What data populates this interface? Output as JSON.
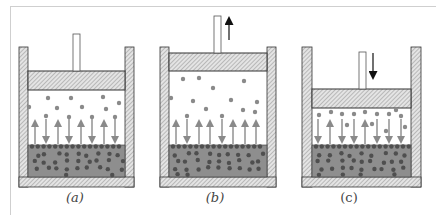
{
  "figure": {
    "panels": [
      {
        "id": "a",
        "label": "(a)",
        "label_x": 60,
        "wall_left_x": 19,
        "wall_right_x": 125,
        "wall_width": 9,
        "wall_top_y": 47,
        "floor_bottom_y": 187,
        "piston_top_y": 71,
        "piston_bottom_y": 90,
        "rod_x": 73,
        "rod_width": 7,
        "rod_top_y": 34,
        "motion_arrow": null,
        "liquid_top_y": 145,
        "liquid_bottom_y": 177,
        "arrows": [
          {
            "x": 35,
            "dir": "up"
          },
          {
            "x": 46,
            "dir": "down"
          },
          {
            "x": 58,
            "dir": "up"
          },
          {
            "x": 69,
            "dir": "down"
          },
          {
            "x": 81,
            "dir": "up"
          },
          {
            "x": 92,
            "dir": "down"
          },
          {
            "x": 104,
            "dir": "up"
          },
          {
            "x": 115,
            "dir": "down"
          }
        ],
        "gas_particles": [
          [
            48,
            98
          ],
          [
            71,
            98
          ],
          [
            103,
            97
          ],
          [
            29,
            107
          ],
          [
            57,
            108
          ],
          [
            82,
            107
          ],
          [
            106,
            109
          ],
          [
            119,
            103
          ],
          [
            46,
            116
          ],
          [
            69,
            117
          ],
          [
            92,
            117
          ],
          [
            115,
            117
          ]
        ]
      },
      {
        "id": "b",
        "label": "(b)",
        "label_x": 200,
        "wall_left_x": 160,
        "wall_right_x": 267,
        "wall_width": 9,
        "wall_top_y": 47,
        "floor_bottom_y": 187,
        "piston_top_y": 53,
        "piston_bottom_y": 71,
        "rod_x": 214,
        "rod_width": 7,
        "rod_top_y": 16,
        "motion_arrow": {
          "x": 229,
          "dir": "up",
          "y1": 17,
          "y2": 40
        },
        "liquid_top_y": 145,
        "liquid_bottom_y": 177,
        "arrows": [
          {
            "x": 176,
            "dir": "up"
          },
          {
            "x": 187,
            "dir": "down"
          },
          {
            "x": 199,
            "dir": "up"
          },
          {
            "x": 210,
            "dir": "up"
          },
          {
            "x": 222,
            "dir": "down"
          },
          {
            "x": 233,
            "dir": "up"
          },
          {
            "x": 245,
            "dir": "up"
          },
          {
            "x": 256,
            "dir": "up"
          }
        ],
        "gas_particles": [
          [
            183,
            79
          ],
          [
            199,
            78
          ],
          [
            213,
            88
          ],
          [
            244,
            81
          ],
          [
            171,
            98
          ],
          [
            193,
            101
          ],
          [
            231,
            100
          ],
          [
            257,
            102
          ],
          [
            206,
            109
          ],
          [
            243,
            110
          ],
          [
            187,
            116
          ],
          [
            222,
            116
          ],
          [
            255,
            112
          ]
        ]
      },
      {
        "id": "c",
        "label": "(c)",
        "label_x": 347,
        "wall_left_x": 302,
        "wall_right_x": 411,
        "wall_width": 10,
        "wall_top_y": 47,
        "floor_bottom_y": 187,
        "piston_top_y": 89,
        "piston_bottom_y": 108,
        "rod_x": 359,
        "rod_width": 7,
        "rod_top_y": 52,
        "motion_arrow": {
          "x": 373,
          "dir": "down",
          "y1": 53,
          "y2": 79
        },
        "liquid_top_y": 145,
        "liquid_bottom_y": 177,
        "arrows": [
          {
            "x": 318,
            "dir": "down"
          },
          {
            "x": 330,
            "dir": "up"
          },
          {
            "x": 342,
            "dir": "down"
          },
          {
            "x": 354,
            "dir": "down"
          },
          {
            "x": 365,
            "dir": "up"
          },
          {
            "x": 377,
            "dir": "down"
          },
          {
            "x": 389,
            "dir": "down"
          },
          {
            "x": 401,
            "dir": "down"
          }
        ],
        "gas_particles": [
          [
            319,
            115
          ],
          [
            331,
            112
          ],
          [
            342,
            114
          ],
          [
            354,
            114
          ],
          [
            365,
            112
          ],
          [
            377,
            114
          ],
          [
            389,
            114
          ],
          [
            396,
            110
          ],
          [
            401,
            116
          ],
          [
            347,
            125
          ],
          [
            372,
            124
          ],
          [
            405,
            127
          ],
          [
            386,
            131
          ]
        ]
      }
    ],
    "colors": {
      "wall_hatch_bg": "#e4e4e4",
      "wall_hatch_line": "#9a9a9a",
      "outline": "#333333",
      "liquid": "#8e8e8e",
      "liquid_particle": "#4f4f4f",
      "gas_particle": "#8a8a8a",
      "flux_arrow": "#8a8a8a",
      "motion_arrow": "#111111"
    }
  }
}
